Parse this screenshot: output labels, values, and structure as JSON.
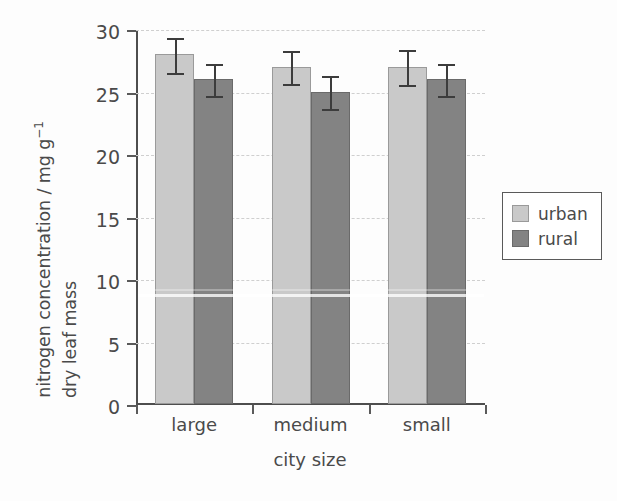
{
  "chart_data": {
    "type": "bar",
    "title": "",
    "xlabel": "city size",
    "ylabel_line1": "nitrogen concentration / mg g",
    "ylabel_sup": "−1",
    "ylabel_line2": "dry leaf mass",
    "categories": [
      "large",
      "medium",
      "small"
    ],
    "series": [
      {
        "name": "urban",
        "color": "#c9c9c9",
        "values": [
          28,
          27,
          27
        ],
        "errors": [
          1.4,
          1.3,
          1.4
        ]
      },
      {
        "name": "rural",
        "color": "#838383",
        "values": [
          26,
          25,
          26
        ],
        "errors": [
          1.3,
          1.3,
          1.3
        ]
      }
    ],
    "ylim": [
      0,
      30
    ],
    "yticks": [
      0,
      5,
      10,
      15,
      20,
      25,
      30
    ],
    "ytick_labels": [
      "0",
      "5",
      "10",
      "15",
      "20",
      "25",
      "30"
    ],
    "grid": true,
    "grid_style": "dashed",
    "legend_position": "right"
  },
  "legend": {
    "entries": [
      {
        "label": "urban"
      },
      {
        "label": "rural"
      }
    ]
  }
}
